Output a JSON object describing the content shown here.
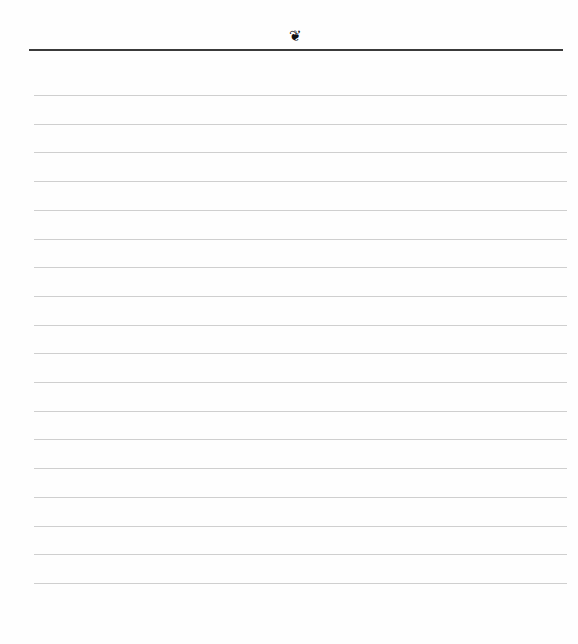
{
  "page": {
    "header": {
      "ornament_icon": "floral-heart-icon",
      "ornament_glyph": "❦"
    },
    "ruled_lines": {
      "count": 18,
      "first_y": 95,
      "spacing": 28.7,
      "color": "#cfcfcf"
    },
    "top_rule_color": "#3a3a3a",
    "background": "#fefefe"
  }
}
